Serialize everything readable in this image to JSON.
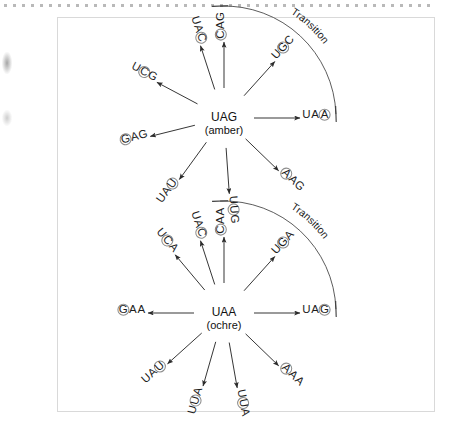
{
  "page": {
    "frame": {
      "visible": true
    }
  },
  "figures": [
    {
      "id": "amber",
      "center_codon": "UAG",
      "center_name": "(amber)",
      "transition_label": "Transition",
      "variants": [
        {
          "id": "uag-uac",
          "text": "UAC",
          "circled_index": 2,
          "angle_deg": -108
        },
        {
          "id": "uag-cag",
          "text": "CAG",
          "circled_index": 0,
          "angle_deg": -90
        },
        {
          "id": "uag-ugc",
          "text": "UGC",
          "circled_index": 1,
          "angle_deg": -48
        },
        {
          "id": "uag-uaa",
          "text": "UAA",
          "circled_index": 2,
          "angle_deg": 0
        },
        {
          "id": "uag-aag",
          "text": "AAG",
          "circled_index": 0,
          "angle_deg": 44
        },
        {
          "id": "uag-uug",
          "text": "UUG",
          "circled_index": 1,
          "angle_deg": 86
        },
        {
          "id": "uag-uau",
          "text": "UAU",
          "circled_index": 2,
          "angle_deg": 126
        },
        {
          "id": "uag-gag",
          "text": "GAG",
          "circled_index": 0,
          "angle_deg": 166
        },
        {
          "id": "uag-ucg",
          "text": "UCG",
          "circled_index": 1,
          "angle_deg": -152
        }
      ]
    },
    {
      "id": "ochre",
      "center_codon": "UAA",
      "center_name": "(ochre)",
      "transition_label": "Transition",
      "variants": [
        {
          "id": "uaa-uca",
          "text": "UCA",
          "circled_index": 1,
          "angle_deg": -130
        },
        {
          "id": "uaa-uac",
          "text": "UAC",
          "circled_index": 2,
          "angle_deg": -108
        },
        {
          "id": "uaa-caa",
          "text": "CAA",
          "circled_index": 0,
          "angle_deg": -90
        },
        {
          "id": "uaa-uga",
          "text": "UGA",
          "circled_index": 1,
          "angle_deg": -48
        },
        {
          "id": "uaa-uag",
          "text": "UAG",
          "circled_index": 2,
          "angle_deg": 0
        },
        {
          "id": "uaa-aaa",
          "text": "AAA",
          "circled_index": 0,
          "angle_deg": 44
        },
        {
          "id": "uaa-uua-b",
          "text": "UUA",
          "circled_index": 1,
          "angle_deg": 80
        },
        {
          "id": "uaa-uua-a",
          "text": "UUA",
          "circled_index": 1,
          "angle_deg": 106
        },
        {
          "id": "uaa-uau",
          "text": "UAU",
          "circled_index": 2,
          "angle_deg": 138
        },
        {
          "id": "uaa-gaa",
          "text": "GAA",
          "circled_index": 0,
          "angle_deg": 180
        }
      ]
    }
  ],
  "colors": {
    "ink": "#1d1d1d",
    "circle_stroke": "#8d8d8d",
    "arrow": "#2b2b2b",
    "frame": "#d9d9d9"
  }
}
